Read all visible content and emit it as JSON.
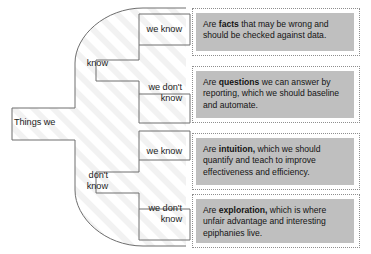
{
  "diagram": {
    "root": {
      "label": "Things we"
    },
    "colors": {
      "card_fill": "#bfbfbf",
      "card_border": "#8e8e8e",
      "stroke": "#6e6e6e",
      "text": "#1d1d1d",
      "background": "#ffffff"
    },
    "branches": [
      {
        "name": "know",
        "label": "know",
        "leaves": [
          {
            "name": "know-we-know",
            "label": "we know",
            "card": {
              "prefix": "Are ",
              "keyword": "facts",
              "suffix": " that may be wrong and should be checked against data."
            }
          },
          {
            "name": "know-we-dont-know",
            "label": "we don't\nknow",
            "card": {
              "prefix": "Are ",
              "keyword": "questions",
              "suffix": " we can answer by reporting, which we should baseline and automate."
            }
          }
        ]
      },
      {
        "name": "dont-know",
        "label": "don't\nknow",
        "leaves": [
          {
            "name": "dont-know-we-know",
            "label": "we know",
            "card": {
              "prefix": "Are ",
              "keyword": "intuition,",
              "suffix": " which we should quantify and teach to improve effectiveness and efficiency."
            }
          },
          {
            "name": "dont-know-we-dont-know",
            "label": "we don't\nknow",
            "card": {
              "prefix": "Are ",
              "keyword": "exploration,",
              "suffix": " which is where unfair advantage and interesting epiphanies live."
            }
          }
        ]
      }
    ]
  }
}
